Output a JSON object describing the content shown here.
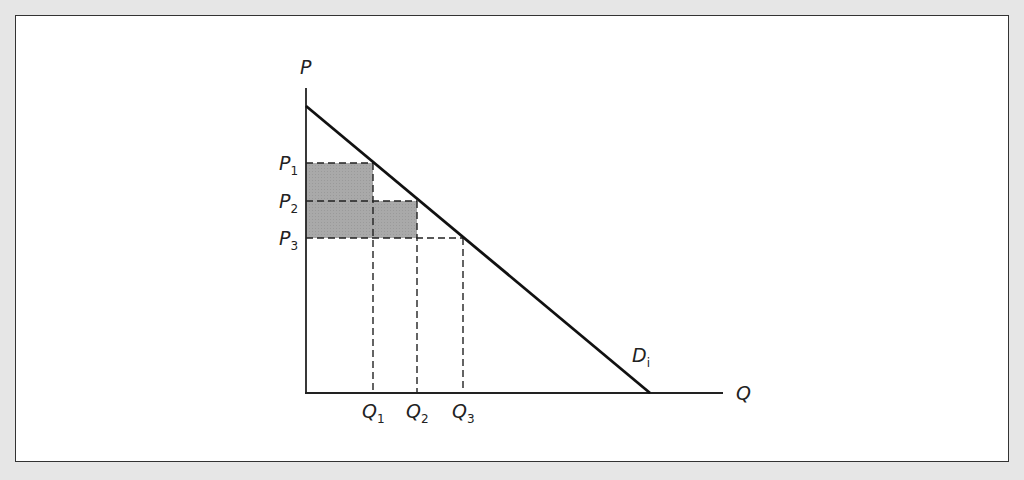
{
  "diagram": {
    "type": "economics-demand-price-discrimination",
    "y_axis_label": "P",
    "x_axis_label": "Q",
    "curve_label": {
      "main": "D",
      "sub": "i"
    },
    "price_levels": [
      {
        "main": "P",
        "sub": "1"
      },
      {
        "main": "P",
        "sub": "2"
      },
      {
        "main": "P",
        "sub": "3"
      }
    ],
    "quantity_levels": [
      {
        "main": "Q",
        "sub": "1"
      },
      {
        "main": "Q",
        "sub": "2"
      },
      {
        "main": "Q",
        "sub": "3"
      }
    ],
    "colors": {
      "shaded_area": "#a8a8a8",
      "lines": "#111111",
      "background": "#e6e6e6",
      "panel": "#ffffff"
    }
  }
}
